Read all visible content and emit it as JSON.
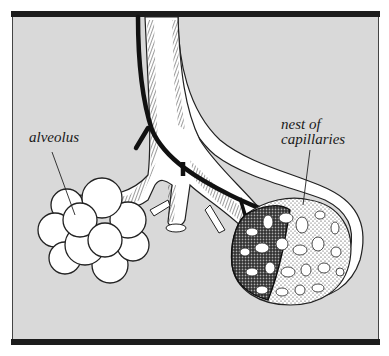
{
  "diagram": {
    "type": "anatomical-illustration",
    "background_color": "#d9d9d9",
    "frame_color": "#1c1c1c",
    "labels": {
      "alveolus": "alveolus",
      "capillaries_line1": "nest of",
      "capillaries_line2": "capillaries"
    },
    "parts": [
      {
        "id": "bronchiole",
        "description": "branching air tube with hatched edges"
      },
      {
        "id": "blood-vessel",
        "description": "dark vessel running alongside bronchiole"
      },
      {
        "id": "alveolus-cluster",
        "description": "cluster of round air sacs"
      },
      {
        "id": "capillary-nest",
        "description": "stippled mesh of capillaries wrapping an alveolar sac"
      }
    ]
  }
}
